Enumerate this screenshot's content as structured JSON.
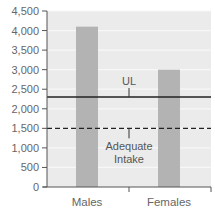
{
  "chart_data": {
    "type": "bar",
    "title": "",
    "xlabel": "",
    "ylabel": "",
    "categories": [
      "Males",
      "Females"
    ],
    "values": [
      4100,
      3000
    ],
    "ylim": [
      0,
      4500
    ],
    "yticks": [
      0,
      500,
      1000,
      1500,
      2000,
      2500,
      3000,
      3500,
      4000,
      4500
    ],
    "ytick_labels": [
      "0",
      "500",
      "1,000",
      "1,500",
      "2,000",
      "2,500",
      "3,000",
      "3,500",
      "4,000",
      "4,500"
    ],
    "grid": true,
    "legend": null,
    "reference_lines": [
      {
        "name": "UL",
        "label": "UL",
        "value": 2300,
        "style": "solid"
      },
      {
        "name": "Adequate Intake",
        "label_lines": [
          "Adequate",
          "Intake"
        ],
        "value": 1500,
        "style": "dashed"
      }
    ],
    "colors": {
      "plot_background": "#ebebeb",
      "gridline": "#f7f7f7",
      "bar": "#b3b3b3",
      "axis": "#555555",
      "reference_line": "#222222"
    }
  },
  "labels": {
    "ul": "UL",
    "ai_line1": "Adequate",
    "ai_line2": "Intake"
  }
}
